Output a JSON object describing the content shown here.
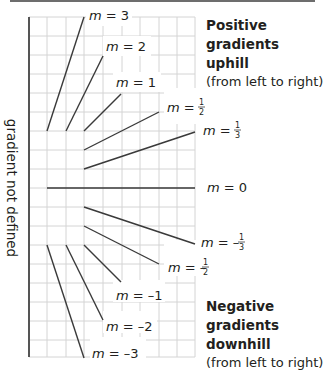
{
  "diagram": {
    "axis_label": "gradient not defined",
    "positive_block": {
      "heading_lines": [
        "Positive",
        "gradients",
        "uphill"
      ],
      "subtext": "(from left to right)"
    },
    "negative_block": {
      "heading_lines": [
        "Negative",
        "gradients",
        "downhill"
      ],
      "subtext": "(from left to right)"
    },
    "lines": [
      {
        "label_m": "m",
        "label_eq": " = ",
        "label_val": "3",
        "gradient": 3
      },
      {
        "label_m": "m",
        "label_eq": " = ",
        "label_val": "2",
        "gradient": 2
      },
      {
        "label_m": "m",
        "label_eq": " = ",
        "label_val": "1",
        "gradient": 1
      },
      {
        "label_m": "m",
        "label_eq": " = ",
        "label_num": "1",
        "label_den": "2",
        "gradient": 0.5
      },
      {
        "label_m": "m",
        "label_eq": " = ",
        "label_num": "1",
        "label_den": "3",
        "gradient": 0.3333
      },
      {
        "label_m": "m",
        "label_eq": " = ",
        "label_val": "0",
        "gradient": 0
      },
      {
        "label_m": "m",
        "label_eq": " = –",
        "label_num": "1",
        "label_den": "3",
        "gradient": -0.3333
      },
      {
        "label_m": "m",
        "label_eq": " = –",
        "label_num": "1",
        "label_den": "2",
        "gradient": -0.5
      },
      {
        "label_m": "m",
        "label_eq": " = ",
        "label_val": "–1",
        "gradient": -1
      },
      {
        "label_m": "m",
        "label_eq": " = ",
        "label_val": "–2",
        "gradient": -2
      },
      {
        "label_m": "m",
        "label_eq": " = ",
        "label_val": "–3",
        "gradient": -3
      }
    ],
    "colors": {
      "grid": "#d4d4d4",
      "line": "#3a3a3a",
      "text": "#231f20",
      "axis": "#555555"
    }
  }
}
